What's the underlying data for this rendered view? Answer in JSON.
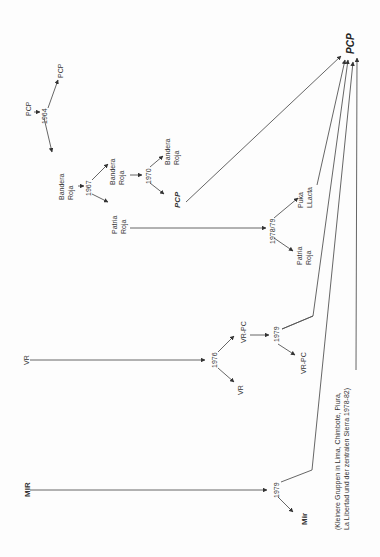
{
  "diagram": {
    "orientation": "rotated-90-ccw",
    "final_node": "PCP",
    "nodes": {
      "pcp_origin": "PCP",
      "y1964": "1964",
      "pcp_1964": "PCP",
      "bandera_roja_1": [
        "Bandera",
        "Roja"
      ],
      "y1967": "1967",
      "bandera_roja_2": [
        "Bandera",
        "Roja"
      ],
      "y1970": "1970",
      "bandera_roja_3": [
        "Bandera",
        "Roja"
      ],
      "pcp_1970": "PCP",
      "patria_roja_1": [
        "Patria",
        "Roja"
      ],
      "y1978_79": "1978/79",
      "puka_llacta": [
        "Puka",
        "LLacta"
      ],
      "patria_roja_2": [
        "Patria",
        "Roja"
      ],
      "vr_origin": "VR",
      "y1976": "1976",
      "vr_pc_1": "VR-PC",
      "vr_1976": "VR",
      "y1979_vr": "1979",
      "vr_pc_2": "VR-PC",
      "mir_origin": "MIR",
      "y1979_mir": "1979",
      "mir_1979": "Mir",
      "note": [
        "(Kleinere Gruppen in Lima, Chimbote, Piura,",
        "La Libertad und der zentralen Sierra 1978-82)"
      ]
    },
    "edges": [
      [
        "PCP",
        "1964"
      ],
      [
        "1964",
        "PCP"
      ],
      [
        "1964",
        "Bandera Roja"
      ],
      [
        "Bandera Roja",
        "1967"
      ],
      [
        "1967",
        "Bandera Roja"
      ],
      [
        "1967",
        "Patria Roja"
      ],
      [
        "Bandera Roja",
        "1970"
      ],
      [
        "1970",
        "Bandera Roja"
      ],
      [
        "1970",
        "PCP"
      ],
      [
        "PCP (1970)",
        "PCP (final)"
      ],
      [
        "Patria Roja",
        "1978/79"
      ],
      [
        "1978/79",
        "Puka LLacta"
      ],
      [
        "1978/79",
        "Patria Roja"
      ],
      [
        "Puka LLacta",
        "PCP (final)"
      ],
      [
        "VR",
        "1976"
      ],
      [
        "1976",
        "VR-PC"
      ],
      [
        "1976",
        "VR"
      ],
      [
        "VR-PC",
        "1979"
      ],
      [
        "1979",
        "VR-PC"
      ],
      [
        "VR-PC (1979)",
        "PCP (final)"
      ],
      [
        "MIR",
        "1979"
      ],
      [
        "1979",
        "Mir"
      ],
      [
        "1979 (MIR)",
        "PCP (final)"
      ],
      [
        "Kleinere Gruppen",
        "PCP (final)"
      ]
    ]
  }
}
